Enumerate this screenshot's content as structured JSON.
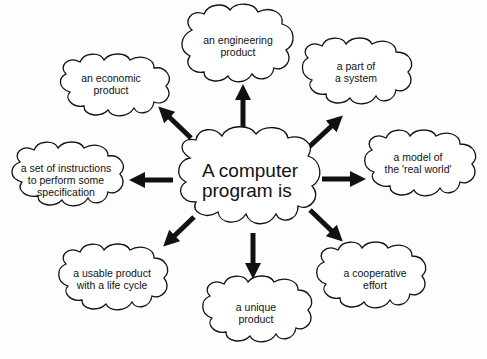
{
  "diagram": {
    "type": "mind-map",
    "center": {
      "id": "center",
      "text": "A computer\nprogram is"
    },
    "nodes": [
      {
        "id": "engineering",
        "text": "an engineering\nproduct"
      },
      {
        "id": "economic",
        "text": "an economic\nproduct"
      },
      {
        "id": "system",
        "text": "a part of\na system"
      },
      {
        "id": "instructions",
        "text": "a set of instructions\nto perform some\nspecification"
      },
      {
        "id": "model",
        "text": "a model of\nthe 'real world'"
      },
      {
        "id": "usable",
        "text": "a usable product\nwith a life cycle"
      },
      {
        "id": "unique",
        "text": "a unique\nproduct"
      },
      {
        "id": "cooperative",
        "text": "a cooperative\neffort"
      }
    ],
    "edges": [
      {
        "from": "center",
        "to": "engineering",
        "direction": "up"
      },
      {
        "from": "center",
        "to": "economic",
        "direction": "up-left"
      },
      {
        "from": "center",
        "to": "system",
        "direction": "up-right"
      },
      {
        "from": "center",
        "to": "instructions",
        "direction": "left"
      },
      {
        "from": "center",
        "to": "model",
        "direction": "right"
      },
      {
        "from": "center",
        "to": "usable",
        "direction": "down-left"
      },
      {
        "from": "center",
        "to": "unique",
        "direction": "down"
      },
      {
        "from": "center",
        "to": "cooperative",
        "direction": "down-right"
      }
    ],
    "colors": {
      "stroke": "#111111",
      "fill": "#ffffff",
      "background": "#fdfdfb"
    }
  }
}
